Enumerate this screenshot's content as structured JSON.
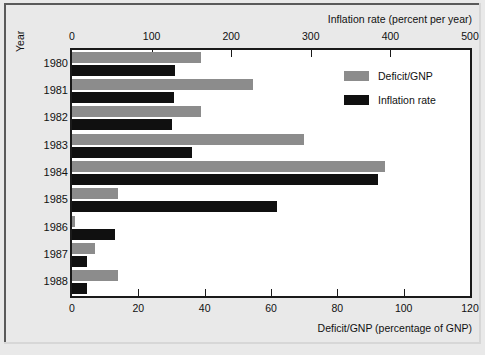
{
  "chart_data": {
    "type": "bar",
    "orientation": "horizontal",
    "title": "",
    "categories": [
      "1980",
      "1981",
      "1982",
      "1983",
      "1984",
      "1985",
      "1986",
      "1987",
      "1988"
    ],
    "ylabel": "Year",
    "grid": false,
    "legend_position": "top-right",
    "series": [
      {
        "name": "Deficit/GNP",
        "color": "#8c8c8c",
        "axis": "bottom",
        "axis_label": "Deficit/GNP (percentage of GNP)",
        "unit": "percentage of GNP",
        "values": [
          39,
          54.5,
          39,
          70,
          94.5,
          14,
          1,
          7,
          14
        ]
      },
      {
        "name": "Inflation rate",
        "color": "#101010",
        "axis": "top",
        "axis_label": "Inflation rate (percent per year)",
        "unit": "percent per year",
        "values": [
          130,
          128,
          125,
          151,
          385,
          257,
          54,
          19,
          19
        ]
      }
    ],
    "axes": {
      "top": {
        "label": "Inflation rate (percent per year)",
        "ticks": [
          "0",
          "100",
          "200",
          "300",
          "400",
          "500"
        ],
        "tick_values": [
          0,
          100,
          200,
          300,
          400,
          500
        ],
        "range": [
          0,
          500
        ]
      },
      "bottom": {
        "label": "Deficit/GNP (percentage of GNP)",
        "ticks": [
          "0",
          "20",
          "40",
          "60",
          "80",
          "100",
          "120"
        ],
        "tick_values": [
          0,
          20,
          40,
          60,
          80,
          100,
          120
        ],
        "range": [
          0,
          120
        ]
      }
    }
  },
  "legend": {
    "items": [
      {
        "label": "Deficit/GNP",
        "color": "#8c8c8c"
      },
      {
        "label": "Inflation rate",
        "color": "#101010"
      }
    ]
  },
  "colors": {
    "deficit": "#8c8c8c",
    "inflation": "#101010",
    "background": "#e9e9e9",
    "plot_background": "#ffffff",
    "frame": "#1a1a1a"
  }
}
